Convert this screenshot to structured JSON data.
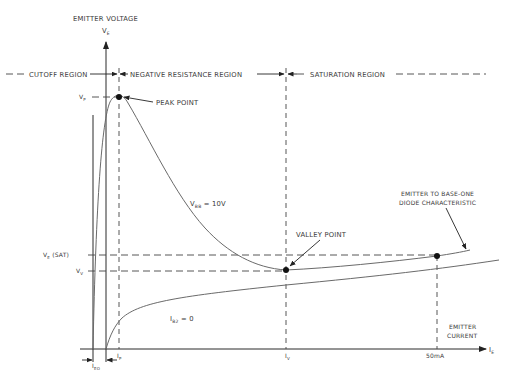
{
  "axes": {
    "y_title": "EMITTER VOLTAGE",
    "y_symbol": "V",
    "y_symbol_sub": "E",
    "x_title_line1": "EMITTER",
    "x_title_line2": "CURRENT",
    "x_symbol": "I",
    "x_symbol_sub": "E"
  },
  "regions": {
    "cutoff": "CUTOFF REGION",
    "negative_resistance": "NEGATIVE RESISTANCE REGION",
    "saturation": "SATURATION REGION"
  },
  "y_ticks": {
    "vp": "V",
    "vp_sub": "P",
    "ve_sat": "V",
    "ve_sat_sub": "E",
    "ve_sat_suffix": " (SAT)",
    "vv": "V",
    "vv_sub": "V"
  },
  "x_ticks": {
    "ip": "I",
    "ip_sub": "P",
    "iv": "I",
    "iv_sub": "V",
    "i50": "50mA",
    "ieo": "I",
    "ieo_sub": "EO"
  },
  "annotations": {
    "peak_point": "PEAK POINT",
    "valley_point": "VALLEY POINT",
    "vbb_label": "V",
    "vbb_sub": "BB",
    "vbb_value": " = 10V",
    "ib2_label": "I",
    "ib2_sub": "B2",
    "ib2_value": " = 0",
    "diode_line1": "EMITTER TO BASE-ONE",
    "diode_line2": "DIODE CHARACTERISTIC"
  },
  "colors": {
    "axis": "#2a2a2a",
    "curve": "#6a6a6a",
    "text": "#3a3a3a"
  }
}
